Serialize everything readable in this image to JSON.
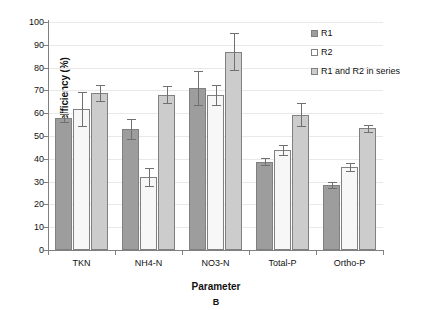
{
  "chart_data": {
    "type": "bar",
    "title": "",
    "panel_letter": "B",
    "xlabel": "Parameter",
    "ylabel": "Removal efficiency (%)",
    "categories": [
      "TKN",
      "NH4-N",
      "NO3-N",
      "Total-P",
      "Ortho-P"
    ],
    "ylim": [
      0,
      100
    ],
    "ytick_labels": [
      "0",
      "10",
      "20",
      "30",
      "40",
      "50",
      "60",
      "70",
      "80",
      "90",
      "100"
    ],
    "ytick_values": [
      0,
      10,
      20,
      30,
      40,
      50,
      60,
      70,
      80,
      90,
      100
    ],
    "grid": true,
    "legend_position": "top-right",
    "series": [
      {
        "name": "R1",
        "color": "#9d9d9d",
        "values": [
          58.0,
          53.0,
          71.0,
          38.8,
          28.7
        ],
        "errors": [
          1.8,
          4.5,
          7.3,
          1.7,
          1.3
        ]
      },
      {
        "name": "R2",
        "color": "#f7f7f7",
        "values": [
          62.0,
          32.0,
          68.0,
          43.8,
          36.5
        ],
        "errors": [
          7.5,
          3.8,
          4.3,
          2.2,
          1.8
        ]
      },
      {
        "name": "R1 and R2 in series",
        "color": "#cccccc",
        "values": [
          69.0,
          68.2,
          87.0,
          59.3,
          53.4
        ],
        "errors": [
          3.5,
          3.8,
          8.2,
          5.0,
          1.5
        ]
      }
    ]
  },
  "legend": {
    "items": [
      {
        "label": "R1"
      },
      {
        "label": "R2"
      },
      {
        "label": "R1 and R2 in series"
      }
    ]
  }
}
